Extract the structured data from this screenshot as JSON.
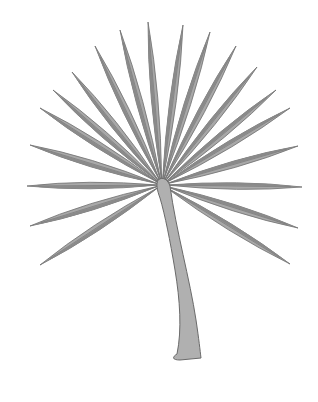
{
  "image": {
    "subject": "Fan palm leaf illustration",
    "colors": {
      "background": "#ffffff",
      "leaflet_fill": "#a8a8a8",
      "leaflet_shade": "#8a8a8a",
      "leaflet_stroke": "#6e6e6e",
      "stem_fill": "#b0b0b0",
      "stem_stroke": "#6a6a6a"
    },
    "hub": [
      162,
      185
    ],
    "leaflet_tips": [
      [
        40,
        265
      ],
      [
        30,
        226
      ],
      [
        27,
        186
      ],
      [
        30,
        145
      ],
      [
        40,
        108
      ],
      [
        53,
        90
      ],
      [
        72,
        72
      ],
      [
        95,
        46
      ],
      [
        120,
        30
      ],
      [
        148,
        22
      ],
      [
        183,
        25
      ],
      [
        210,
        32
      ],
      [
        236,
        46
      ],
      [
        257,
        67
      ],
      [
        276,
        90
      ],
      [
        290,
        108
      ],
      [
        298,
        146
      ],
      [
        302,
        187
      ],
      [
        298,
        228
      ],
      [
        290,
        264
      ]
    ]
  }
}
